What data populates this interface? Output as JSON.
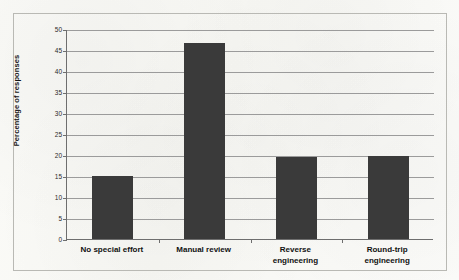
{
  "chart_data": {
    "type": "bar",
    "title": "",
    "subtitle": "",
    "xlabel": "",
    "ylabel": "Percentage of responses",
    "categories": [
      "No special effort",
      "Manual review",
      "Reverse engineering",
      "Round-trip engineering"
    ],
    "category_lines": [
      [
        "No special effort"
      ],
      [
        "Manual review"
      ],
      [
        "Reverse",
        "engineering"
      ],
      [
        "Round-trip",
        "engineering"
      ]
    ],
    "values": [
      15,
      46.7,
      19.6,
      19.7
    ],
    "ylim": [
      0,
      50
    ],
    "ytick_step": 5,
    "ytick_labels": [
      "0",
      "5",
      "10",
      "15",
      "20",
      "25",
      "30",
      "35",
      "40",
      "45",
      "50"
    ],
    "grid": true,
    "grid_orientation": "horizontal",
    "legend": false,
    "legend_position": "none",
    "bar_color": "#3a3a3a",
    "gridline_color": "#9b9b9b",
    "axis_color": "#6e6e6e",
    "frame_color": "#b9b9b4",
    "background_color": "#fdfdfb"
  }
}
